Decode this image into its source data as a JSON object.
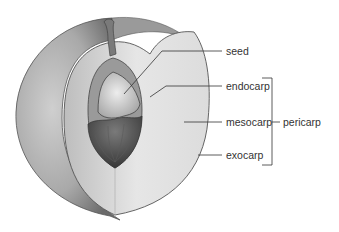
{
  "diagram": {
    "labels": {
      "seed": "seed",
      "endocarp": "endocarp",
      "mesocarp": "mesocarp",
      "exocarp": "exocarp",
      "pericarp": "pericarp"
    },
    "bracket_groups": [
      {
        "label": "pericarp",
        "members": [
          "endocarp",
          "mesocarp",
          "exocarp"
        ]
      }
    ],
    "colors": {
      "background": "#ffffff",
      "skin": "#b8b8b8",
      "skin_dark": "#6e6e6e",
      "flesh": "#e4e4e4",
      "endocarp": "#9a9a9a",
      "seed": "#d8d8d8",
      "pit_shell": "#4a4a4a",
      "outline": "#555555",
      "leader_line": "#333333",
      "text": "#333333"
    }
  }
}
